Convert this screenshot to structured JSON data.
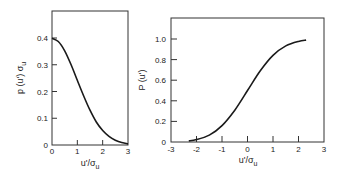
{
  "chart_data": [
    {
      "type": "line",
      "title": "",
      "xlabel": "u'/σu",
      "ylabel": "p(u') σu",
      "xlim": [
        0,
        3
      ],
      "ylim": [
        0,
        0.5
      ],
      "xticks": [
        "0",
        "1",
        "2",
        "3"
      ],
      "yticks": [
        "0",
        "0.1",
        "0.2",
        "0.3",
        "0.4"
      ],
      "grid": false,
      "series": [
        {
          "name": "Gaussian PDF",
          "x": [
            0,
            0.25,
            0.5,
            0.75,
            1.0,
            1.25,
            1.5,
            1.75,
            2.0,
            2.25,
            2.5,
            2.75,
            3.0
          ],
          "y": [
            0.399,
            0.387,
            0.352,
            0.301,
            0.242,
            0.183,
            0.13,
            0.086,
            0.054,
            0.032,
            0.018,
            0.009,
            0.004
          ]
        }
      ]
    },
    {
      "type": "line",
      "title": "",
      "xlabel": "u'/σu",
      "ylabel": "P (u')",
      "xlim": [
        -3,
        3
      ],
      "ylim": [
        0,
        1.2
      ],
      "xticks": [
        "-3",
        "-2",
        "-1",
        "0",
        "1",
        "2",
        "3"
      ],
      "yticks": [
        "0",
        "0.2",
        "0.4",
        "0.6",
        "0.8",
        "1.0"
      ],
      "grid": false,
      "series": [
        {
          "name": "Gaussian CDF",
          "x": [
            -2.3,
            -2.0,
            -1.5,
            -1.0,
            -0.5,
            0,
            0.5,
            1.0,
            1.5,
            2.0,
            2.3
          ],
          "y": [
            0.011,
            0.023,
            0.067,
            0.159,
            0.309,
            0.5,
            0.691,
            0.841,
            0.933,
            0.977,
            0.989
          ]
        }
      ]
    }
  ],
  "left_chart": {
    "ylabel_main": "p (u') σ",
    "ylabel_sub": "u",
    "xlabel_main": "u'/σ",
    "xlabel_sub": "u",
    "xticks": [
      "0",
      "1",
      "2",
      "3"
    ],
    "yticks": [
      "0",
      "0.1",
      "0.2",
      "0.3",
      "0.4"
    ]
  },
  "right_chart": {
    "ylabel": "P (u')",
    "xlabel_main": "u'/σ",
    "xlabel_sub": "u",
    "xticks": [
      "-3",
      "-2",
      "-1",
      "0",
      "1",
      "2",
      "3"
    ],
    "yticks": [
      "0",
      "0.2",
      "0.4",
      "0.6",
      "0.8",
      "1.0"
    ]
  },
  "colors": {
    "line": "#1a1a1a",
    "frame": "#333333",
    "background": "#ffffff"
  }
}
